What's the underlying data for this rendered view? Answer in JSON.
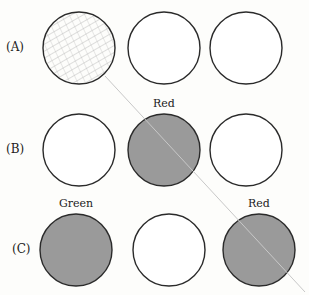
{
  "rows": [
    {
      "label": "(A)",
      "y": 48,
      "circles": [
        {
          "x": 79,
          "fill": "hatched",
          "label": ""
        },
        {
          "x": 164,
          "fill": "white",
          "label": ""
        },
        {
          "x": 246,
          "fill": "white",
          "label": ""
        }
      ]
    },
    {
      "label": "(B)",
      "y": 150,
      "circles": [
        {
          "x": 79,
          "fill": "white",
          "label": ""
        },
        {
          "x": 164,
          "fill": "gray",
          "label": "Red"
        },
        {
          "x": 246,
          "fill": "white",
          "label": ""
        }
      ]
    },
    {
      "label": "(C)",
      "y": 250,
      "circles": [
        {
          "x": 76,
          "fill": "gray",
          "label": "Green"
        },
        {
          "x": 169,
          "fill": "white",
          "label": ""
        },
        {
          "x": 259,
          "fill": "gray",
          "label": "Red"
        }
      ]
    }
  ],
  "colors": {
    "stroke": "#2a2a2a",
    "gray": "#9a9a9a",
    "line": "#c8c8c8",
    "hatch": "#9c9c9c"
  }
}
